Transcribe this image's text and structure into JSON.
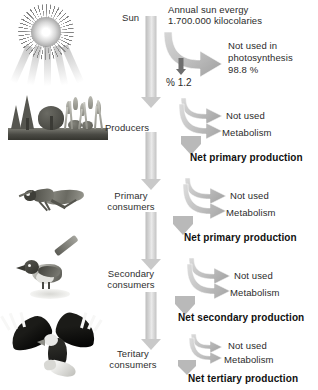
{
  "diagram": {
    "type": "energy-flow-pyramid"
  },
  "sun": {
    "label": "Sun",
    "energy_title": "Annual sun evergy",
    "energy_value": "1.700.000 kilocolaries",
    "loss_label": "Not used in",
    "loss_label_2": "photosynthesis",
    "loss_value": "98.8 %",
    "transfer_value": "% 1.2"
  },
  "levels": [
    {
      "id": "producers",
      "label_line1": "Producers",
      "label_line2": "",
      "organism": "vegetation",
      "loss_not_used": "Not used",
      "loss_metabolism": "Metabolism",
      "net_production": "Net primary production"
    },
    {
      "id": "primary-consumers",
      "label_line1": "Primary",
      "label_line2": "consumers",
      "organism": "grasshopper",
      "loss_not_used": "Not used",
      "loss_metabolism": "Metabolism",
      "net_production": "Net primary production"
    },
    {
      "id": "secondary-consumers",
      "label_line1": "Secondary",
      "label_line2": "consumers",
      "organism": "bird",
      "loss_not_used": "Not used",
      "loss_metabolism": "Metabolism",
      "net_production": "Net secondary production"
    },
    {
      "id": "tertiary-consumers",
      "label_line1": "Teritary",
      "label_line2": "consumers",
      "organism": "eagle",
      "loss_not_used": "Not used",
      "loss_metabolism": "Metabolism",
      "net_production": "Net tertiary production"
    }
  ],
  "colors": {
    "background": "#ffffff",
    "text": "#2b2b2b",
    "net_text": "#111111",
    "arrow_light": "#c9c9c9",
    "arrow_dark": "#6e6e6e",
    "ground": "#3f3f39"
  }
}
